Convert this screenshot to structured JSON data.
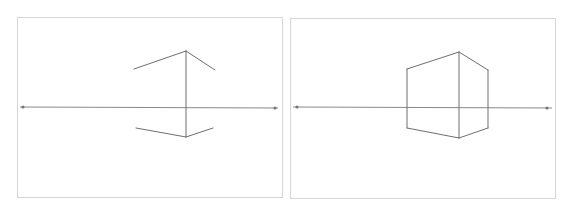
{
  "figure": {
    "colors": {
      "background": "#ffffff",
      "frame": "#d6d6d6",
      "horizon": "#8a8a8a",
      "edges": "#6e6e6e",
      "vanishing_point": "#777777"
    },
    "panels": [
      {
        "id": "step-1",
        "frame": {
          "x": 17,
          "y": 17,
          "w": 265,
          "h": 180
        },
        "horizon": {
          "x1": 20,
          "y1": 107,
          "x2": 278,
          "y2": 108
        },
        "vanishing_points": [
          {
            "x": 23,
            "y": 107
          },
          {
            "x": 275,
            "y": 108
          }
        ],
        "lines": [
          {
            "x1": 186,
            "y1": 51,
            "x2": 186,
            "y2": 137
          },
          {
            "x1": 186,
            "y1": 51,
            "x2": 134,
            "y2": 69
          },
          {
            "x1": 186,
            "y1": 51,
            "x2": 215,
            "y2": 70
          },
          {
            "x1": 186,
            "y1": 137,
            "x2": 136,
            "y2": 128
          },
          {
            "x1": 186,
            "y1": 137,
            "x2": 213,
            "y2": 128
          }
        ]
      },
      {
        "id": "step-2",
        "frame": {
          "x": 290,
          "y": 18,
          "w": 265,
          "h": 180
        },
        "horizon": {
          "x1": 293,
          "y1": 107,
          "x2": 552,
          "y2": 108
        },
        "vanishing_points": [
          {
            "x": 297,
            "y": 107
          },
          {
            "x": 547,
            "y": 108
          }
        ],
        "lines": [
          {
            "x1": 459,
            "y1": 52,
            "x2": 459,
            "y2": 138
          },
          {
            "x1": 459,
            "y1": 52,
            "x2": 407,
            "y2": 69
          },
          {
            "x1": 459,
            "y1": 52,
            "x2": 488,
            "y2": 70
          },
          {
            "x1": 459,
            "y1": 138,
            "x2": 407,
            "y2": 128
          },
          {
            "x1": 459,
            "y1": 138,
            "x2": 488,
            "y2": 128
          },
          {
            "x1": 407,
            "y1": 69,
            "x2": 407,
            "y2": 128
          },
          {
            "x1": 488,
            "y1": 70,
            "x2": 488,
            "y2": 128
          }
        ]
      }
    ]
  }
}
